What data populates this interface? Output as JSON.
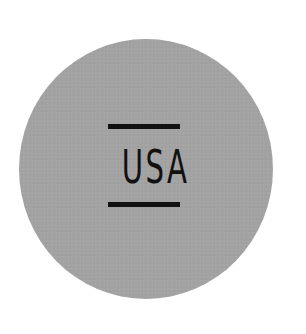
{
  "badge": {
    "text": "USA",
    "background_color": "#a3a3a3",
    "foreground_color": "#111111"
  }
}
